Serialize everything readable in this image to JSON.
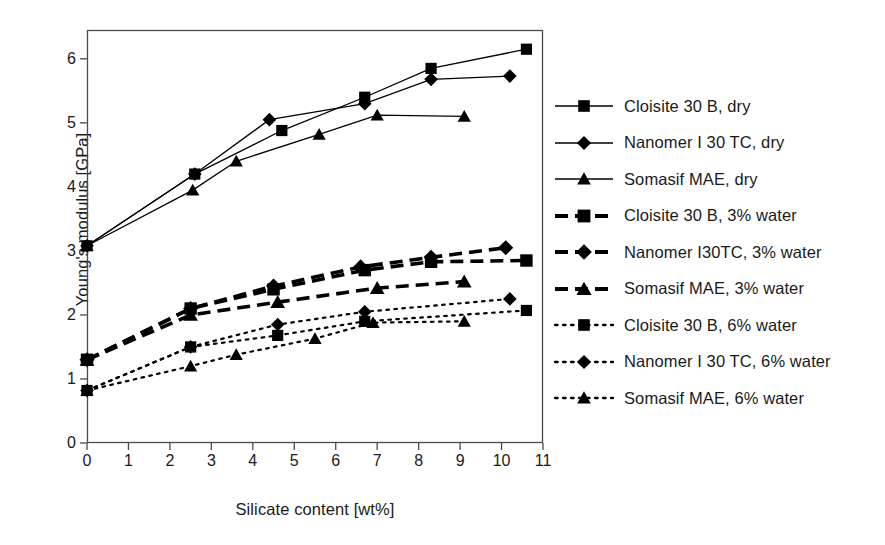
{
  "chart_data": {
    "type": "line",
    "title": "",
    "xlabel": "Silicate content [wt%]",
    "ylabel": "Young's modulus [GPa]",
    "xlim": [
      0,
      11
    ],
    "ylim": [
      0,
      6.45
    ],
    "xticks": [
      "0",
      "1",
      "2",
      "3",
      "4",
      "5",
      "6",
      "7",
      "8",
      "9",
      "10",
      "11"
    ],
    "yticks": [
      "0",
      "1",
      "2",
      "3",
      "4",
      "5",
      "6"
    ],
    "grid": false,
    "legend_position": "right",
    "color": "#000000",
    "series": [
      {
        "name": "Cloisite 30 B, dry",
        "marker": "square",
        "line": "solid",
        "width": "thin",
        "x": [
          0.0,
          2.6,
          4.7,
          6.7,
          8.3,
          10.6
        ],
        "y": [
          3.08,
          4.2,
          4.88,
          5.4,
          5.85,
          6.15
        ]
      },
      {
        "name": "Nanomer I 30 TC, dry",
        "marker": "diamond",
        "line": "solid",
        "width": "thin",
        "x": [
          0.0,
          2.6,
          4.4,
          6.7,
          8.3,
          10.2
        ],
        "y": [
          3.08,
          4.2,
          5.05,
          5.3,
          5.68,
          5.73
        ]
      },
      {
        "name": "Somasif MAE, dry",
        "marker": "triangle",
        "line": "solid",
        "width": "thin",
        "x": [
          0.0,
          2.55,
          3.6,
          5.6,
          7.0,
          9.1
        ],
        "y": [
          3.08,
          3.95,
          4.4,
          4.82,
          5.12,
          5.1
        ]
      },
      {
        "name": "Cloisite 30 B, 3% water",
        "marker": "square",
        "line": "dashed",
        "width": "thick",
        "x": [
          0.0,
          2.5,
          4.5,
          6.7,
          8.3,
          10.6
        ],
        "y": [
          1.3,
          2.1,
          2.4,
          2.7,
          2.83,
          2.85
        ]
      },
      {
        "name": "Nanomer I30TC, 3% water",
        "marker": "diamond",
        "line": "dashed",
        "width": "thick",
        "x": [
          0.0,
          2.5,
          4.5,
          6.6,
          8.3,
          10.1
        ],
        "y": [
          1.3,
          2.1,
          2.45,
          2.75,
          2.9,
          3.05
        ]
      },
      {
        "name": "Somasif MAE, 3% water",
        "marker": "triangle",
        "line": "dashed",
        "width": "thick",
        "x": [
          0.0,
          2.5,
          4.6,
          7.0,
          9.1
        ],
        "y": [
          1.3,
          2.0,
          2.2,
          2.42,
          2.52
        ]
      },
      {
        "name": "Cloisite 30 B, 6% water",
        "marker": "square",
        "line": "dotted",
        "width": "thin",
        "x": [
          0.0,
          2.5,
          4.6,
          6.7,
          10.6
        ],
        "y": [
          0.82,
          1.5,
          1.68,
          1.9,
          2.07
        ]
      },
      {
        "name": "Nanomer I 30 TC, 6% water",
        "marker": "diamond",
        "line": "dotted",
        "width": "thin",
        "x": [
          0.0,
          2.5,
          4.6,
          6.7,
          10.2
        ],
        "y": [
          0.82,
          1.5,
          1.85,
          2.05,
          2.25
        ]
      },
      {
        "name": "Somasif MAE, 6% water",
        "marker": "triangle",
        "line": "dotted",
        "width": "thin",
        "x": [
          0.0,
          2.5,
          3.6,
          5.5,
          6.9,
          9.1
        ],
        "y": [
          0.82,
          1.2,
          1.38,
          1.63,
          1.88,
          1.9
        ]
      }
    ]
  },
  "legend": {
    "items": [
      {
        "label": "Cloisite 30 B, dry",
        "marker": "square",
        "line": "solid"
      },
      {
        "label": "Nanomer I 30 TC, dry",
        "marker": "diamond",
        "line": "solid"
      },
      {
        "label": "Somasif MAE, dry",
        "marker": "triangle",
        "line": "solid"
      },
      {
        "label": "Cloisite 30 B, 3% water",
        "marker": "square",
        "line": "dashed"
      },
      {
        "label": "Nanomer I30TC, 3% water",
        "marker": "diamond",
        "line": "dashed"
      },
      {
        "label": "Somasif MAE, 3% water",
        "marker": "triangle",
        "line": "dashed"
      },
      {
        "label": "Cloisite 30 B, 6% water",
        "marker": "square",
        "line": "dotted"
      },
      {
        "label": "Nanomer I 30 TC, 6% water",
        "marker": "diamond",
        "line": "dotted"
      },
      {
        "label": "Somasif MAE, 6% water",
        "marker": "triangle",
        "line": "dotted"
      }
    ]
  }
}
